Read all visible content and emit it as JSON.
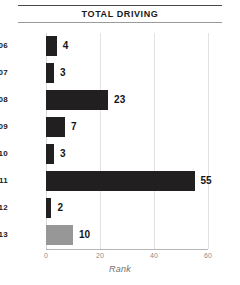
{
  "chart_data": {
    "type": "bar",
    "orientation": "horizontal",
    "title": "TOTAL DRIVING",
    "xlabel": "Rank",
    "ylabel": "",
    "xlim": [
      0,
      60
    ],
    "xticks": [
      0,
      20,
      40,
      60
    ],
    "xtick_labels": [
      "0",
      "20",
      "40",
      "60"
    ],
    "grid": true,
    "grid_axis": "x",
    "legend": false,
    "categories": [
      "2006",
      "2007",
      "2008",
      "2009",
      "2010",
      "2011",
      "2012",
      "2013"
    ],
    "values": [
      4,
      3,
      23,
      7,
      3,
      55,
      2,
      10
    ],
    "value_labels": [
      "4",
      "3",
      "23",
      "7",
      "3",
      "55",
      "2",
      "10"
    ],
    "bar_colors": [
      "#211f1f",
      "#211f1f",
      "#211f1f",
      "#211f1f",
      "#211f1f",
      "#211f1f",
      "#211f1f",
      "#979797"
    ],
    "highlight_category": "2013",
    "colors": {
      "bar_default": "#211f1f",
      "bar_highlight": "#979797",
      "grid": "#e2e2e2",
      "axis": "#b5b5b5",
      "title_rule": "#4a4a4a",
      "text": "#1a1a1a",
      "tick_text": "#8d8d8d",
      "axis_label_text": "#6f6f6f"
    }
  }
}
